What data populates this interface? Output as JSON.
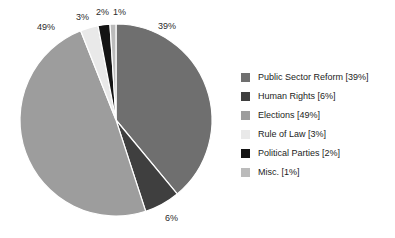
{
  "chart_data": {
    "type": "pie",
    "title": "",
    "subtitle": "",
    "xlabel": "",
    "ylabel": "",
    "legend_position": "right",
    "grid": false,
    "start_angle_deg": 0,
    "direction": "clockwise",
    "categories": [
      "Public Sector Reform",
      "Human Rights",
      "Elections",
      "Rule of Law",
      "Political Parties",
      "Misc."
    ],
    "values": [
      39,
      6,
      49,
      3,
      2,
      1
    ],
    "value_unit": "%",
    "colors": [
      "#6f6f6f",
      "#3f3f3f",
      "#9d9d9d",
      "#e9e9e9",
      "#141414",
      "#bbbbbb"
    ],
    "slice_labels": [
      "39%",
      "6%",
      "49%",
      "3%",
      "2%",
      "1%"
    ],
    "legend_entries": [
      "Public Sector Reform [39%]",
      "Human Rights [6%]",
      "Elections [49%]",
      "Rule of Law [3%]",
      "Political Parties [2%]",
      "Misc. [1%]"
    ]
  },
  "pie": {
    "labels": [
      {
        "text": "39%",
        "left": 158,
        "top": 21
      },
      {
        "text": "6%",
        "left": 165,
        "top": 213
      },
      {
        "text": "49%",
        "left": 37,
        "top": 22
      },
      {
        "text": "3%",
        "left": 76,
        "top": 12
      },
      {
        "text": "2%",
        "left": 96,
        "top": 7
      },
      {
        "text": "1%",
        "left": 113,
        "top": 7
      }
    ]
  },
  "colors": {
    "background": "#ffffff",
    "text": "#1c1c1c",
    "slice_border": "#ffffff"
  }
}
